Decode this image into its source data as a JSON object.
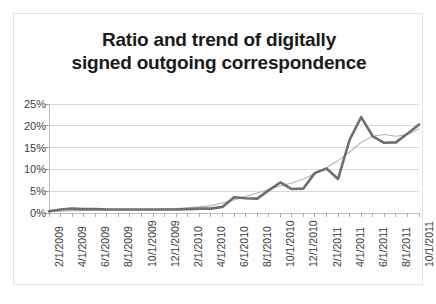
{
  "chart_data": {
    "type": "line",
    "title": "Ratio and trend of digitally signed outgoing correspondence",
    "title_lines": [
      "Ratio and trend of digitally",
      "signed outgoing correspondence"
    ],
    "xlabel": "",
    "ylabel": "",
    "ylim": [
      0,
      25
    ],
    "ytick_labels": [
      "0%",
      "5%",
      "10%",
      "15%",
      "20%",
      "25%"
    ],
    "ytick_values": [
      0,
      5,
      10,
      15,
      20,
      25
    ],
    "grid": true,
    "legend": "none",
    "x_tick_labels": [
      "2/1/2009",
      "4/1/2009",
      "6/1/2009",
      "8/1/2009",
      "10/1/2009",
      "12/1/2009",
      "2/1/2010",
      "4/1/2010",
      "6/1/2010",
      "8/1/2010",
      "10/1/2010",
      "12/1/2010",
      "2/1/2011",
      "4/1/2011",
      "6/1/2011",
      "8/1/2011",
      "10/1/2011"
    ],
    "x": [
      "2/1/2009",
      "3/1/2009",
      "4/1/2009",
      "5/1/2009",
      "6/1/2009",
      "7/1/2009",
      "8/1/2009",
      "9/1/2009",
      "10/1/2009",
      "11/1/2009",
      "12/1/2009",
      "1/1/2010",
      "2/1/2010",
      "3/1/2010",
      "4/1/2010",
      "5/1/2010",
      "6/1/2010",
      "7/1/2010",
      "8/1/2010",
      "9/1/2010",
      "10/1/2010",
      "11/1/2010",
      "12/1/2010",
      "1/1/2011",
      "2/1/2011",
      "3/1/2011",
      "4/1/2011",
      "5/1/2011",
      "6/1/2011",
      "7/1/2011",
      "8/1/2011",
      "9/1/2011",
      "10/1/2011"
    ],
    "series": [
      {
        "name": "Ratio of digitally signed outgoing correspondence",
        "color": "#6e6e6e",
        "width": 2.6,
        "values": [
          0.4,
          0.8,
          1.0,
          0.9,
          0.9,
          0.8,
          0.8,
          0.8,
          0.8,
          0.8,
          0.8,
          0.8,
          0.9,
          1.0,
          1.0,
          1.4,
          3.6,
          3.4,
          3.3,
          5.2,
          7.0,
          5.5,
          5.6,
          9.2,
          10.2,
          7.8,
          16.8,
          22.0,
          17.6,
          16.1,
          16.2,
          18.2,
          20.3
        ]
      },
      {
        "name": "Trend",
        "color": "#b3b3b3",
        "width": 1.1,
        "values": [
          0.3,
          0.4,
          0.5,
          0.6,
          0.7,
          0.7,
          0.8,
          0.8,
          0.8,
          0.8,
          0.9,
          1.0,
          1.2,
          1.4,
          1.7,
          2.3,
          3.0,
          3.8,
          4.6,
          5.4,
          6.2,
          6.9,
          7.8,
          9.0,
          10.4,
          12.0,
          14.0,
          16.2,
          17.6,
          18.0,
          17.6,
          18.0,
          19.3
        ]
      }
    ]
  }
}
